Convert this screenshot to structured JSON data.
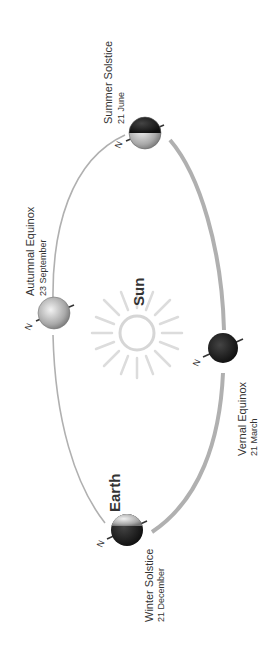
{
  "diagram": {
    "sun_label": "Sun",
    "earth_label": "Earth",
    "north_marker": "N",
    "positions": [
      {
        "name": "Summer Solstice",
        "date": "21 June"
      },
      {
        "name": "Autumnal Equinox",
        "date": "23 September"
      },
      {
        "name": "Vernal Equinox",
        "date": "21 March"
      },
      {
        "name": "Winter Solstice",
        "date": "21 December"
      }
    ],
    "colors": {
      "orbit": "#aaaaaa",
      "text": "#333333",
      "sun_rays": "#dddddd",
      "earth_dark": "#1a1a1a",
      "earth_light": "#bbbbbb"
    }
  }
}
